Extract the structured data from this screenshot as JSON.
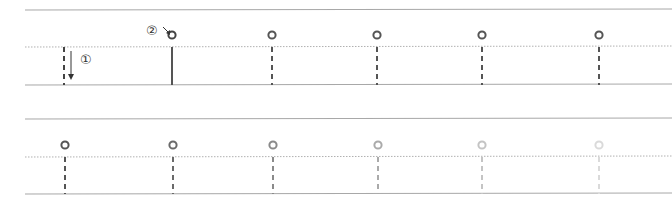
{
  "diagram": {
    "line_color": "#a8a8a8",
    "dotted_color": "#b0b0b0",
    "bands": [
      {
        "id": "top",
        "top_y": 10,
        "mid_y": 47,
        "bottom_y": 85,
        "strokes": [
          {
            "x": 64,
            "style": "dashed",
            "color": "#444444",
            "circle": false
          },
          {
            "x": 172,
            "style": "solid",
            "color": "#555555",
            "circle": true,
            "circle_color": "#444444"
          },
          {
            "x": 272,
            "style": "dashed",
            "color": "#555555",
            "circle": true,
            "circle_color": "#555555"
          },
          {
            "x": 377,
            "style": "dashed",
            "color": "#555555",
            "circle": true,
            "circle_color": "#555555"
          },
          {
            "x": 482,
            "style": "dashed",
            "color": "#555555",
            "circle": true,
            "circle_color": "#555555"
          },
          {
            "x": 599,
            "style": "dashed",
            "color": "#555555",
            "circle": true,
            "circle_color": "#555555"
          }
        ]
      },
      {
        "id": "bottom",
        "top_y": 119,
        "mid_y": 157,
        "bottom_y": 194,
        "strokes": [
          {
            "x": 65,
            "style": "dashed",
            "color": "#555555",
            "circle": true,
            "circle_color": "#555555"
          },
          {
            "x": 173,
            "style": "dashed",
            "color": "#6a6a6a",
            "circle": true,
            "circle_color": "#6a6a6a"
          },
          {
            "x": 273,
            "style": "dashed",
            "color": "#8a8a8a",
            "circle": true,
            "circle_color": "#8a8a8a"
          },
          {
            "x": 378,
            "style": "dashed",
            "color": "#aaaaaa",
            "circle": true,
            "circle_color": "#aaaaaa"
          },
          {
            "x": 482,
            "style": "dashed",
            "color": "#c4c4c4",
            "circle": true,
            "circle_color": "#c4c4c4"
          },
          {
            "x": 599,
            "style": "dashed",
            "color": "#dadada",
            "circle": true,
            "circle_color": "#dadada"
          }
        ]
      }
    ],
    "annotations": [
      {
        "label": "①",
        "meaning": "stroke direction: downward",
        "x": 80,
        "y": 64
      },
      {
        "label": "②",
        "meaning": "start point of stroke",
        "x": 153,
        "y": 35
      }
    ]
  }
}
